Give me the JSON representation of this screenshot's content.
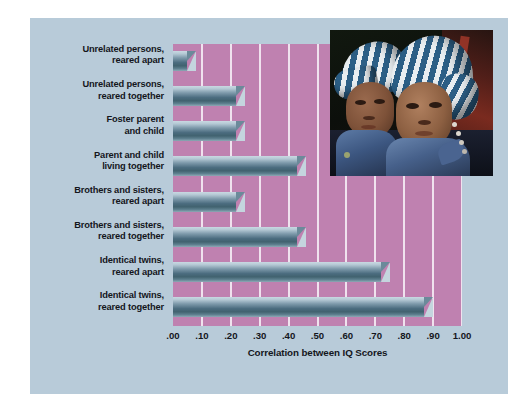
{
  "chart_data": {
    "type": "bar",
    "orientation": "horizontal",
    "title": "",
    "xlabel": "Correlation between IQ Scores",
    "ylabel": "",
    "xlim": [
      0.0,
      1.0
    ],
    "grid": true,
    "legend": "none",
    "categories": [
      "Unrelated persons,\nreared apart",
      "Unrelated persons,\nreared together",
      "Foster parent\nand child",
      "Parent and child\nliving together",
      "Brothers and sisters,\nreared apart",
      "Brothers and sisters,\nreared together",
      "Identical twins,\nreared apart",
      "Identical twins,\nreared together"
    ],
    "values": [
      0.08,
      0.25,
      0.25,
      0.46,
      0.25,
      0.46,
      0.75,
      0.9
    ],
    "tick_labels": [
      ".00",
      ".10",
      ".20",
      ".30",
      ".40",
      ".50",
      ".60",
      ".70",
      ".80",
      ".90",
      "1.00"
    ],
    "tick_values": [
      0.0,
      0.1,
      0.2,
      0.3,
      0.4,
      0.5,
      0.6,
      0.7,
      0.8,
      0.9,
      1.0
    ],
    "colors": {
      "panel_background": "#b8cbd9",
      "plot_background": "#bf81b0",
      "gridline": "#f0e2ee",
      "bar_light": "#c9d9e2",
      "bar_dark": "#41626f",
      "text": "#14161c"
    }
  },
  "categories": [
    {
      "line1": "Unrelated persons,",
      "line2": "reared apart"
    },
    {
      "line1": "Unrelated persons,",
      "line2": "reared together"
    },
    {
      "line1": "Foster parent",
      "line2": "and child"
    },
    {
      "line1": "Parent and child",
      "line2": "living together"
    },
    {
      "line1": "Brothers and sisters,",
      "line2": "reared apart"
    },
    {
      "line1": "Brothers and sisters,",
      "line2": "reared together"
    },
    {
      "line1": "Identical twins,",
      "line2": "reared apart"
    },
    {
      "line1": "Identical twins,",
      "line2": "reared together"
    }
  ],
  "axis": {
    "title": "Correlation between IQ Scores"
  },
  "photo": {
    "description": "Two infant twins wearing matching blue and white striped hats and blue scarves",
    "alt": "twin-infants-photo"
  }
}
